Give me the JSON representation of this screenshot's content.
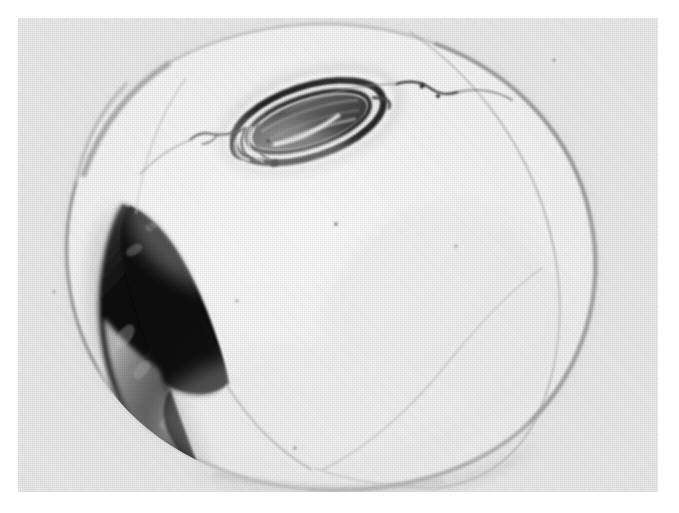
{
  "figure": {
    "kind": "halftone-micrograph",
    "caption": "",
    "label": "",
    "background_color": "#ffffff",
    "plate_color": "#ececec",
    "plate": {
      "x": 18,
      "y": 18,
      "width": 640,
      "height": 474
    }
  },
  "specimen": {
    "name": "ovoid-specimen",
    "description": "Large rounded ovoid cell occupying most of the plate",
    "outline_color": "#b3b3b3",
    "interior_color": "#f4f4f4",
    "membrane_line_color": "#9a9a9a",
    "center": {
      "cx": 300,
      "cy": 245
    },
    "radius": {
      "rx": 262,
      "ry": 225
    }
  },
  "features": [
    {
      "id": "dark-crescent",
      "name": "dark-crescent-region",
      "position": "lower-left",
      "tone": "#151515",
      "secondary_tone": "#5d5d5d"
    },
    {
      "id": "inclusion",
      "name": "elliptical-inclusion",
      "position": "upper-center",
      "tone": "#565656",
      "ring_tone": "#2b2b2b",
      "highlight_tone": "#f2f2f2"
    },
    {
      "id": "filament",
      "name": "thin-dark-filament",
      "position": "upper-right",
      "tone": "#1d1d1d"
    },
    {
      "id": "inner-membrane",
      "name": "inner-membrane-line",
      "position": "right",
      "tone": "#a8a8a8"
    },
    {
      "id": "basal-shadow",
      "name": "basal-shadow-band",
      "position": "bottom",
      "tone": "#c9c9c9"
    }
  ],
  "specks": [
    {
      "x": 318,
      "y": 206,
      "r": 2.0,
      "tone": "#6d6d6d"
    },
    {
      "x": 438,
      "y": 228,
      "r": 1.6,
      "tone": "#8a8a8a"
    },
    {
      "x": 219,
      "y": 283,
      "r": 1.4,
      "tone": "#9a9a9a"
    },
    {
      "x": 277,
      "y": 430,
      "r": 1.8,
      "tone": "#7a7a7a"
    },
    {
      "x": 536,
      "y": 42,
      "r": 1.5,
      "tone": "#8f8f8f"
    },
    {
      "x": 36,
      "y": 274,
      "r": 1.4,
      "tone": "#9c9c9c"
    },
    {
      "x": 404,
      "y": 68,
      "r": 2.4,
      "tone": "#222222"
    },
    {
      "x": 420,
      "y": 78,
      "r": 2.0,
      "tone": "#272727"
    },
    {
      "x": 250,
      "y": 123,
      "r": 2.2,
      "tone": "#1f1f1f"
    }
  ]
}
